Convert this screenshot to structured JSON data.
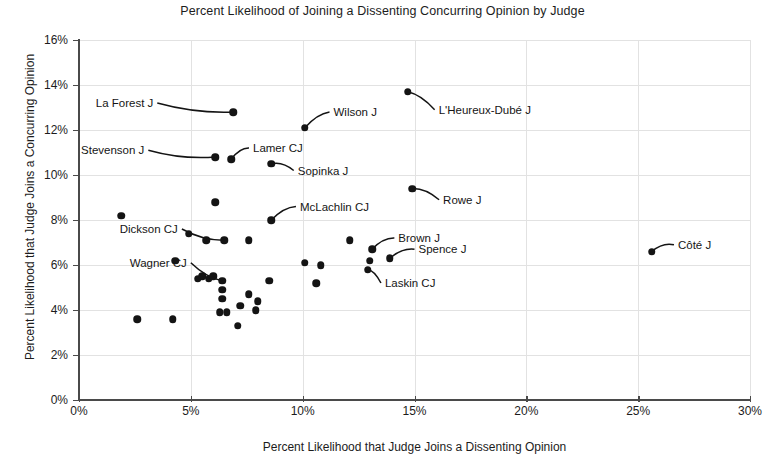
{
  "chart_data": {
    "type": "scatter",
    "title": "Percent Likelihood of Joining a Dissenting Concurring Opinion by Judge",
    "xlabel": "Percent Likelihood that Judge Joins a Dissenting Opinion",
    "ylabel": "Percent Likelihood that Judge Joins a Concurring Opinion",
    "xlim": [
      0,
      30
    ],
    "ylim": [
      0,
      16
    ],
    "x_ticks": [
      0,
      5,
      10,
      15,
      20,
      25,
      30
    ],
    "y_ticks": [
      0,
      2,
      4,
      6,
      8,
      10,
      12,
      14,
      16
    ],
    "x_tick_labels": [
      "0%",
      "5%",
      "10%",
      "15%",
      "20%",
      "25%",
      "30%"
    ],
    "y_tick_labels": [
      "0%",
      "2%",
      "4%",
      "6%",
      "8%",
      "10%",
      "12%",
      "14%",
      "16%"
    ],
    "grid": true,
    "legend": "none",
    "marker_color": "#141414",
    "grid_color": "#e2e2e2",
    "axis_color": "#4a4a4a",
    "points": [
      {
        "label": "La Forest J",
        "x": 6.9,
        "y": 12.8,
        "labeled": true,
        "label_side": "left",
        "label_x": 3.5,
        "label_y": 13.2
      },
      {
        "label": "Wilson J",
        "x": 10.1,
        "y": 12.1,
        "labeled": true,
        "label_side": "right",
        "label_x": 11.2,
        "label_y": 12.8
      },
      {
        "label": "L'Heureux-Dubé J",
        "x": 14.7,
        "y": 13.7,
        "labeled": true,
        "label_side": "right",
        "label_x": 15.9,
        "label_y": 12.9
      },
      {
        "label": "Stevenson J",
        "x": 6.1,
        "y": 10.8,
        "labeled": true,
        "label_side": "left",
        "label_x": 3.1,
        "label_y": 11.1
      },
      {
        "label": "Lamer CJ",
        "x": 6.8,
        "y": 10.7,
        "labeled": true,
        "label_side": "right",
        "label_x": 7.6,
        "label_y": 11.2
      },
      {
        "label": "Sopinka J",
        "x": 8.6,
        "y": 10.5,
        "labeled": true,
        "label_side": "right",
        "label_x": 9.6,
        "label_y": 10.2
      },
      {
        "label": "Rowe J",
        "x": 14.9,
        "y": 9.4,
        "labeled": true,
        "label_side": "right",
        "label_x": 16.1,
        "label_y": 8.9
      },
      {
        "label": "McLachlin CJ",
        "x": 8.6,
        "y": 8.0,
        "labeled": true,
        "label_side": "right",
        "label_x": 9.7,
        "label_y": 8.6
      },
      {
        "label": "Dickson CJ",
        "x": 6.5,
        "y": 7.1,
        "labeled": true,
        "label_side": "left",
        "label_x": 4.6,
        "label_y": 7.6
      },
      {
        "label": "Brown J",
        "x": 13.1,
        "y": 6.7,
        "labeled": true,
        "label_side": "right",
        "label_x": 14.1,
        "label_y": 7.2
      },
      {
        "label": "Spence J",
        "x": 13.9,
        "y": 6.3,
        "labeled": true,
        "label_side": "right",
        "label_x": 15.0,
        "label_y": 6.7
      },
      {
        "label": "Laskin CJ",
        "x": 12.9,
        "y": 5.8,
        "labeled": true,
        "label_side": "right",
        "label_x": 13.5,
        "label_y": 5.2
      },
      {
        "label": "Wagner CJ",
        "x": 6.4,
        "y": 5.3,
        "labeled": true,
        "label_side": "left",
        "label_x": 5.0,
        "label_y": 6.1
      },
      {
        "label": "Côté J",
        "x": 25.6,
        "y": 6.6,
        "labeled": true,
        "label_side": "right",
        "label_x": 26.6,
        "label_y": 6.9
      },
      {
        "label": "",
        "x": 1.9,
        "y": 8.2,
        "labeled": false
      },
      {
        "label": "",
        "x": 6.1,
        "y": 8.8,
        "labeled": false
      },
      {
        "label": "",
        "x": 4.9,
        "y": 7.4,
        "labeled": false
      },
      {
        "label": "",
        "x": 5.7,
        "y": 7.1,
        "labeled": false
      },
      {
        "label": "",
        "x": 7.6,
        "y": 7.1,
        "labeled": false
      },
      {
        "label": "",
        "x": 12.1,
        "y": 7.1,
        "labeled": false
      },
      {
        "label": "",
        "x": 4.3,
        "y": 6.2,
        "labeled": false
      },
      {
        "label": "",
        "x": 10.1,
        "y": 6.1,
        "labeled": false
      },
      {
        "label": "",
        "x": 10.8,
        "y": 6.0,
        "labeled": false
      },
      {
        "label": "",
        "x": 13.0,
        "y": 6.2,
        "labeled": false
      },
      {
        "label": "",
        "x": 5.3,
        "y": 5.4,
        "labeled": false
      },
      {
        "label": "",
        "x": 5.5,
        "y": 5.5,
        "labeled": false
      },
      {
        "label": "",
        "x": 5.8,
        "y": 5.4,
        "labeled": false
      },
      {
        "label": "",
        "x": 6.0,
        "y": 5.5,
        "labeled": false
      },
      {
        "label": "",
        "x": 6.4,
        "y": 4.9,
        "labeled": false
      },
      {
        "label": "",
        "x": 6.4,
        "y": 4.5,
        "labeled": false
      },
      {
        "label": "",
        "x": 8.5,
        "y": 5.3,
        "labeled": false
      },
      {
        "label": "",
        "x": 10.6,
        "y": 5.2,
        "labeled": false
      },
      {
        "label": "",
        "x": 7.6,
        "y": 4.7,
        "labeled": false
      },
      {
        "label": "",
        "x": 8.0,
        "y": 4.4,
        "labeled": false
      },
      {
        "label": "",
        "x": 7.2,
        "y": 4.2,
        "labeled": false
      },
      {
        "label": "",
        "x": 7.9,
        "y": 4.0,
        "labeled": false
      },
      {
        "label": "",
        "x": 6.3,
        "y": 3.9,
        "labeled": false
      },
      {
        "label": "",
        "x": 6.6,
        "y": 3.9,
        "labeled": false
      },
      {
        "label": "",
        "x": 2.6,
        "y": 3.6,
        "labeled": false
      },
      {
        "label": "",
        "x": 4.2,
        "y": 3.6,
        "labeled": false
      },
      {
        "label": "",
        "x": 7.1,
        "y": 3.3,
        "labeled": false
      }
    ]
  }
}
